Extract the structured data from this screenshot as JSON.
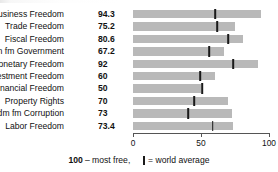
{
  "chart_data": {
    "type": "bar",
    "title": "",
    "xlabel": "",
    "ylabel": "",
    "xlim": [
      0,
      100
    ],
    "grid": false,
    "orientation": "horizontal",
    "categories": [
      "Business Freedom",
      "Trade Freedom",
      "Fiscal Freedom",
      "Fdm fm Government",
      "Monetary Freedom",
      "Investment Freedom",
      "Financial Freedom",
      "Property Rights",
      "Fdm fm Corruption",
      "Labor Freedom"
    ],
    "values": [
      94.3,
      75.2,
      80.6,
      67.2,
      92,
      60,
      50,
      70,
      73,
      73.4
    ],
    "value_labels": [
      "94.3",
      "75.2",
      "80.6",
      "67.2",
      "92",
      "60",
      "50",
      "70",
      "73",
      "73.4"
    ],
    "series": [
      {
        "name": "Country score",
        "values": [
          94.3,
          75.2,
          80.6,
          67.2,
          92,
          60,
          50,
          70,
          73,
          73.4
        ]
      },
      {
        "name": "World average",
        "values": [
          60.5,
          62.0,
          70.0,
          56.0,
          73.5,
          49.5,
          51.0,
          45.0,
          40.5,
          58.5
        ]
      }
    ],
    "xticks": [
      0,
      50,
      100
    ],
    "xtick_labels": [
      "0",
      "50",
      "100"
    ],
    "legend": {
      "note_value": "100",
      "note_text": "– most free,",
      "marker_label": "= world average",
      "position": "bottom"
    },
    "colors": {
      "bar": "#b9b9b9",
      "marker": "#1a1a1a",
      "axis": "#555555",
      "text": "#111111",
      "background": "#ffffff"
    }
  }
}
